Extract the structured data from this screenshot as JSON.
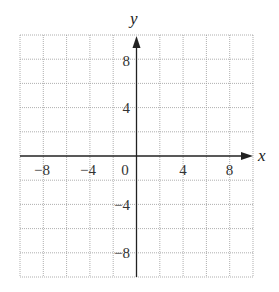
{
  "diagram": {
    "type": "coordinate-grid",
    "axes": {
      "x_label": "x",
      "y_label": "y"
    },
    "x_range": [
      -10,
      10
    ],
    "y_range": [
      -10,
      10
    ],
    "grid_step": 2,
    "x_ticks": [
      {
        "value": -8,
        "label": "−8"
      },
      {
        "value": -4,
        "label": "−4"
      },
      {
        "value": 0,
        "label": "0"
      },
      {
        "value": 4,
        "label": "4"
      },
      {
        "value": 8,
        "label": "8"
      }
    ],
    "y_ticks": [
      {
        "value": 8,
        "label": "8"
      },
      {
        "value": 4,
        "label": "4"
      },
      {
        "value": -4,
        "label": "−4"
      },
      {
        "value": -8,
        "label": "−8"
      }
    ],
    "colors": {
      "axis": "#222222",
      "grid": "#9a9a9a",
      "text": "#333333"
    }
  }
}
